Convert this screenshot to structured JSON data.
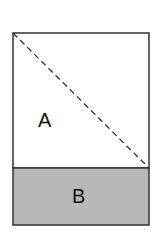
{
  "diagram": {
    "square": {
      "label": "A",
      "fill": "#ffffff",
      "x": 13,
      "y": 33,
      "width": 136,
      "height": 135,
      "diagonal": "dashed"
    },
    "rectangle": {
      "label": "B",
      "fill": "#b8b8b8",
      "x": 13,
      "y": 168,
      "width": 136,
      "height": 57
    },
    "stroke": "#333333"
  }
}
